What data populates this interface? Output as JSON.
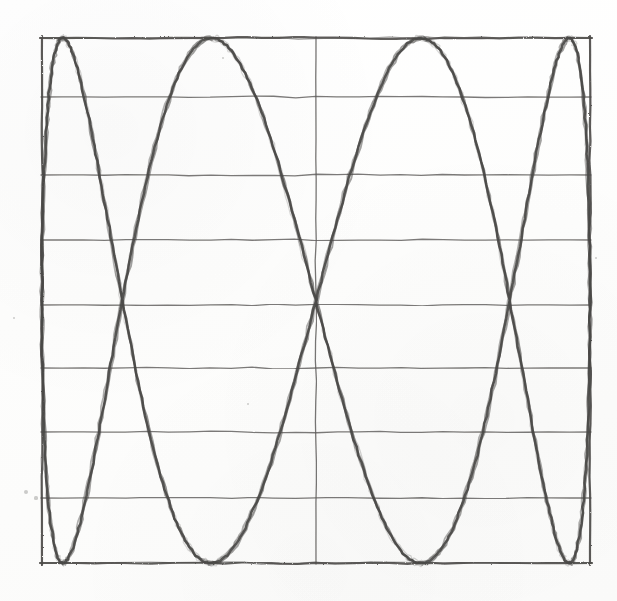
{
  "image": {
    "title": "Hand-drawn Lissajous curve sketch",
    "medium": "graphite pencil on paper",
    "width": 617,
    "height": 601,
    "background_color": "#fefefe",
    "ink_color": "#4a4846",
    "grid_color": "#5a5856"
  },
  "frame": {
    "label": "bounding-box",
    "left": 42,
    "right": 590,
    "top": 38,
    "bottom": 563,
    "stroke_color": "#4e4c4a",
    "stroke_width": 2.2
  },
  "grid": {
    "horizontal_label": "horizontal-division-lines",
    "vertical_label": "center-vertical-line",
    "vertical_lines_x": [
      316
    ],
    "horizontal_lines_y": [
      97,
      175,
      240,
      305,
      368,
      432,
      498
    ],
    "stroke_color": "#5f5d5b",
    "stroke_width": 1.3
  },
  "chart_data": {
    "type": "line",
    "subtitle": "four horizontally elongated lobes between a box frame",
    "xlabel": "",
    "ylabel": "",
    "xlim": [
      42,
      590
    ],
    "ylim": [
      38,
      563
    ],
    "grid": true,
    "legend": "none",
    "parametric": {
      "x_expression": "cx + rx * sin(t)",
      "y_expression": "cy + ry * sin(4*t)",
      "cx": 316,
      "cy": 300.5,
      "rx": 274,
      "ry": 262.5,
      "frequency_x": 1,
      "frequency_y": 4,
      "phase": 0,
      "samples": 720
    },
    "lobes": [
      {
        "name": "lobe-1-top",
        "top_y": 38,
        "bottom_y": 175,
        "left_x": 42,
        "right_x": 590,
        "tangent_y": 97
      },
      {
        "name": "lobe-2-upper-middle",
        "top_y": 175,
        "bottom_y": 305,
        "left_x": 42,
        "right_x": 590,
        "tangent_y": 240
      },
      {
        "name": "lobe-3-lower-middle",
        "top_y": 305,
        "bottom_y": 432,
        "left_x": 42,
        "right_x": 590,
        "tangent_y": 368
      },
      {
        "name": "lobe-4-bottom",
        "top_y": 432,
        "bottom_y": 563,
        "left_x": 42,
        "right_x": 590,
        "tangent_y": 498
      }
    ],
    "crossing_points_y": [
      175,
      305,
      432
    ],
    "tangent_points_left_right_y": [
      97,
      240,
      368,
      498
    ]
  },
  "annotations": {
    "specks": [
      {
        "x": 26,
        "y": 492,
        "r": 2.2
      },
      {
        "x": 36,
        "y": 498,
        "r": 1.6
      },
      {
        "x": 248,
        "y": 404,
        "r": 1.4
      },
      {
        "x": 596,
        "y": 258,
        "r": 1.3
      },
      {
        "x": 14,
        "y": 318,
        "r": 1.1
      },
      {
        "x": 223,
        "y": 58,
        "r": 1.2
      }
    ]
  }
}
